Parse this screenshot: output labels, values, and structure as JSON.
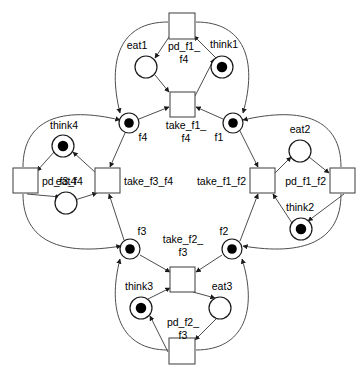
{
  "diagram": {
    "type": "petri-net",
    "colors": {
      "edge": "#4d4d4d",
      "node_stroke": "#1a1a1a",
      "token": "#000000",
      "background": "#ffffff"
    }
  },
  "places": [
    {
      "id": "eat1",
      "label": "eat1",
      "cx": 146,
      "cy": 67,
      "r": 11,
      "tokens": 0,
      "label_x": 137,
      "label_y": 46,
      "anchor": "mid"
    },
    {
      "id": "think1",
      "label": "think1",
      "cx": 222,
      "cy": 67,
      "r": 11,
      "tokens": 1,
      "label_x": 224,
      "label_y": 45,
      "anchor": "mid"
    },
    {
      "id": "eat2",
      "label": "eat2",
      "cx": 300,
      "cy": 151,
      "r": 11,
      "tokens": 0,
      "label_x": 300,
      "label_y": 130,
      "anchor": "mid"
    },
    {
      "id": "think2",
      "label": "think2",
      "cx": 301,
      "cy": 229,
      "r": 11,
      "tokens": 1,
      "label_x": 300,
      "label_y": 208,
      "anchor": "mid"
    },
    {
      "id": "eat3",
      "label": "eat3",
      "cx": 220,
      "cy": 308,
      "r": 11,
      "tokens": 0,
      "label_x": 222,
      "label_y": 287,
      "anchor": "mid"
    },
    {
      "id": "think3",
      "label": "think3",
      "cx": 141,
      "cy": 308,
      "r": 11,
      "tokens": 1,
      "label_x": 139,
      "label_y": 287,
      "anchor": "mid"
    },
    {
      "id": "eat4",
      "label": "eat4",
      "cx": 66,
      "cy": 203,
      "r": 11,
      "tokens": 0,
      "label_x": 66,
      "label_y": 182,
      "anchor": "mid"
    },
    {
      "id": "think4",
      "label": "think4",
      "cx": 63,
      "cy": 146,
      "r": 11,
      "tokens": 1,
      "label_x": 64,
      "label_y": 126,
      "anchor": "mid"
    },
    {
      "id": "f4",
      "label": "f4",
      "cx": 129,
      "cy": 123,
      "r": 10,
      "tokens": 1,
      "label_x": 143,
      "label_y": 138,
      "anchor": "mid"
    },
    {
      "id": "f1",
      "label": "f1",
      "cx": 233,
      "cy": 123,
      "r": 10,
      "tokens": 1,
      "label_x": 219,
      "label_y": 138,
      "anchor": "mid"
    },
    {
      "id": "f2",
      "label": "f2",
      "cx": 232,
      "cy": 249,
      "r": 10,
      "tokens": 1,
      "label_x": 224,
      "label_y": 232,
      "anchor": "mid"
    },
    {
      "id": "f3",
      "label": "f3",
      "cx": 130,
      "cy": 249,
      "r": 10,
      "tokens": 1,
      "label_x": 142,
      "label_y": 232,
      "anchor": "mid"
    }
  ],
  "transitions": [
    {
      "id": "pd_f1_f4",
      "label_line1": "pd_f1_",
      "label_line2": "f4",
      "x": 169,
      "y": 13,
      "w": 26,
      "h": 26,
      "label_x": 184,
      "label_y": 47,
      "label_y2": 60,
      "anchor": "mid"
    },
    {
      "id": "take_f1_f4",
      "label_line1": "take_f1_",
      "label_line2": "f4",
      "x": 170,
      "y": 92,
      "w": 25,
      "h": 25,
      "label_x": 186,
      "label_y": 126,
      "label_y2": 139,
      "anchor": "mid"
    },
    {
      "id": "pd_f1_f2",
      "label_line1": "pd_f1_f2",
      "label_line2": "",
      "x": 330,
      "y": 168,
      "w": 25,
      "h": 25,
      "label_x": 326,
      "label_y": 182,
      "label_y2": 0,
      "anchor": "end"
    },
    {
      "id": "take_f1_f2",
      "label_line1": "take_f1_f2",
      "label_line2": "",
      "x": 250,
      "y": 168,
      "w": 25,
      "h": 25,
      "label_x": 246,
      "label_y": 182,
      "label_y2": 0,
      "anchor": "end"
    },
    {
      "id": "pd_f2_f3",
      "label_line1": "pd_f2_",
      "label_line2": "f3",
      "x": 169,
      "y": 338,
      "w": 26,
      "h": 26,
      "label_x": 183,
      "label_y": 323,
      "label_y2": 336,
      "anchor": "mid"
    },
    {
      "id": "take_f2_f3",
      "label_line1": "take_f2_",
      "label_line2": "f3",
      "x": 170,
      "y": 267,
      "w": 25,
      "h": 25,
      "label_x": 183,
      "label_y": 240,
      "label_y2": 253,
      "anchor": "mid"
    },
    {
      "id": "pd_f3_f4",
      "label_line1": "pd_f3_f4",
      "label_line2": "",
      "x": 13,
      "y": 168,
      "w": 25,
      "h": 25,
      "label_x": 42,
      "label_y": 182,
      "label_y2": 0,
      "anchor": "start"
    },
    {
      "id": "take_f3_f4",
      "label_line1": "take_f3_f4",
      "label_line2": "",
      "x": 95,
      "y": 168,
      "w": 25,
      "h": 25,
      "label_x": 124,
      "label_y": 182,
      "label_y2": 0,
      "anchor": "start"
    }
  ],
  "arcs": [
    {
      "id": "arc-pdf1f4-to-eat1",
      "d": "M 171,34 L 155,58"
    },
    {
      "id": "arc-think1-to-pdf1f4",
      "d": "M 216,58 L 194,36"
    },
    {
      "id": "arc-eat1-to-takef1f4",
      "d": "M 155,75 L 169,92"
    },
    {
      "id": "arc-takef1f4-to-think1",
      "d": "M 195,96 L 214,59"
    },
    {
      "id": "arc-pdf1f4-to-f4",
      "d": "M 168,22 C 120,22 107,60 120,113"
    },
    {
      "id": "arc-pdf1f4-to-f1",
      "d": "M 196,22 C 244,22 258,60 243,113"
    },
    {
      "id": "arc-f4-to-takef1f4",
      "d": "M 139,119 L 169,107"
    },
    {
      "id": "arc-f1-to-takef1f4",
      "d": "M 223,119 L 196,107"
    },
    {
      "id": "arc-f1-to-takef1f2",
      "d": "M 240,131 L 258,167"
    },
    {
      "id": "arc-takef1f2-to-eat2",
      "d": "M 275,173 L 291,157"
    },
    {
      "id": "arc-eat2-to-pdf1f2",
      "d": "M 309,157 L 329,173"
    },
    {
      "id": "arc-pdf1f2-to-think2",
      "d": "M 344,194 L 308,221"
    },
    {
      "id": "arc-think2-to-takef1f2",
      "d": "M 292,223 L 273,194"
    },
    {
      "id": "arc-pdf1f2-to-f1",
      "d": "M 341,167 C 341,119 303,106 243,120"
    },
    {
      "id": "arc-pdf1f2-to-f2",
      "d": "M 341,194 C 341,242 303,256 243,246"
    },
    {
      "id": "arc-f2-to-takef1f2",
      "d": "M 240,241 L 258,194"
    },
    {
      "id": "arc-f2-to-takef2f3",
      "d": "M 222,255 L 196,272"
    },
    {
      "id": "arc-takef2f3-to-eat3",
      "d": "M 193,292 L 215,298"
    },
    {
      "id": "arc-eat3-to-pdf2f3",
      "d": "M 217,318 L 195,340"
    },
    {
      "id": "arc-pdf2f3-to-think3",
      "d": "M 168,352 L 150,316"
    },
    {
      "id": "arc-think3-to-takef2f3",
      "d": "M 148,299 L 170,288"
    },
    {
      "id": "arc-pdf2f3-to-f3",
      "d": "M 168,350 C 120,350 107,310 120,259"
    },
    {
      "id": "arc-pdf2f3-to-f2",
      "d": "M 196,350 C 244,350 258,310 242,259"
    },
    {
      "id": "arc-f3-to-takef2f3",
      "d": "M 140,255 L 170,272"
    },
    {
      "id": "arc-f3-to-takef3f4",
      "d": "M 124,240 L 109,194"
    },
    {
      "id": "arc-takef3f4-to-think4",
      "d": "M 96,173 L 73,152"
    },
    {
      "id": "arc-think4-to-pdf3f4",
      "d": "M 54,152 L 37,171"
    },
    {
      "id": "arc-pdf3f4-to-eat4",
      "d": "M 27,194 L 60,197"
    },
    {
      "id": "arc-eat4-to-takef3f4",
      "d": "M 75,200 L 97,193"
    },
    {
      "id": "arc-pdf3f4-to-f4",
      "d": "M 23,167 C 23,119 62,106 120,120"
    },
    {
      "id": "arc-pdf3f4-to-f3",
      "d": "M 23,194 C 23,242 62,256 121,246"
    },
    {
      "id": "arc-f4-to-takef3f4",
      "d": "M 125,133 L 110,167"
    }
  ],
  "legend": {
    "place_meaning": "place (circle)",
    "token_meaning": "token (filled dot)",
    "transition_meaning": "transition (square)"
  }
}
